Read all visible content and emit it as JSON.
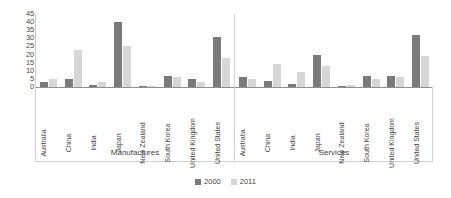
{
  "chart_data": {
    "type": "bar",
    "title": "",
    "xlabel": "",
    "ylabel": "",
    "ylim": [
      0,
      45
    ],
    "ytick_labels": [
      "45",
      "40",
      "35",
      "30",
      "25",
      "20",
      "15",
      "10",
      "5",
      "0"
    ],
    "yticks": [
      45,
      40,
      35,
      30,
      25,
      20,
      15,
      10,
      5,
      0
    ],
    "grid": false,
    "legend_position": "bottom",
    "legend": [
      "2000",
      "2011"
    ],
    "series_colors": {
      "2000": "#7a7a7a",
      "2011": "#d6d6d6"
    },
    "categories": [
      "Australia",
      "China",
      "India",
      "Japan",
      "New Zealand",
      "South Korea",
      "United Kingdom",
      "United States"
    ],
    "panels": [
      {
        "name": "Manufactures",
        "categories": [
          "Australia",
          "China",
          "India",
          "Japan",
          "New Zealand",
          "South Korea",
          "United Kingdom",
          "United States"
        ],
        "series": [
          {
            "name": "2000",
            "values": [
              3,
              5,
              1,
              40,
              0,
              7,
              5,
              31
            ]
          },
          {
            "name": "2011",
            "values": [
              5,
              23,
              3,
              25,
              0,
              6,
              3,
              18
            ]
          }
        ]
      },
      {
        "name": "Services",
        "categories": [
          "Australia",
          "China",
          "India",
          "Japan",
          "New Zealand",
          "South Korea",
          "United Kingdom",
          "United States"
        ],
        "series": [
          {
            "name": "2000",
            "values": [
              6,
              4,
              2,
              20,
              0,
              7,
              7,
              32
            ]
          },
          {
            "name": "2011",
            "values": [
              5,
              14,
              9,
              13,
              1,
              5,
              6,
              19
            ]
          }
        ]
      }
    ]
  },
  "legend": {
    "items": [
      {
        "label": "2000",
        "swatch": "legend-swatch-2000"
      },
      {
        "label": "2011",
        "swatch": "legend-swatch-2011"
      }
    ]
  }
}
